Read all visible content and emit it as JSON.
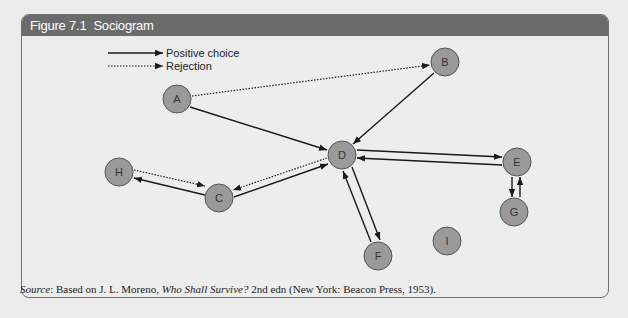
{
  "figure": {
    "number": "Figure 7.1",
    "title": "Sociogram"
  },
  "legend": {
    "positive_label": "Positive choice",
    "rejection_label": "Rejection"
  },
  "nodes": {
    "A": {
      "label": "A",
      "x": 177,
      "y": 99
    },
    "B": {
      "label": "B",
      "x": 445,
      "y": 62
    },
    "C": {
      "label": "C",
      "x": 219,
      "y": 198
    },
    "D": {
      "label": "D",
      "x": 342,
      "y": 155
    },
    "E": {
      "label": "E",
      "x": 517,
      "y": 162
    },
    "F": {
      "label": "F",
      "x": 378,
      "y": 256
    },
    "G": {
      "label": "G",
      "x": 514,
      "y": 212
    },
    "H": {
      "label": "H",
      "x": 119,
      "y": 172
    },
    "I": {
      "label": "I",
      "x": 447,
      "y": 241
    }
  },
  "colors": {
    "node_fill": "#9a9a9a",
    "node_stroke": "#555555",
    "title_bar": "#6b6b6b",
    "edge": "#1a1a1a"
  },
  "source": {
    "label": "Source",
    "text_before": ": Based on J. L. Moreno, ",
    "book_title": "Who Shall Survive?",
    "text_after": " 2nd edn (New York: Beacon Press, 1953)."
  }
}
